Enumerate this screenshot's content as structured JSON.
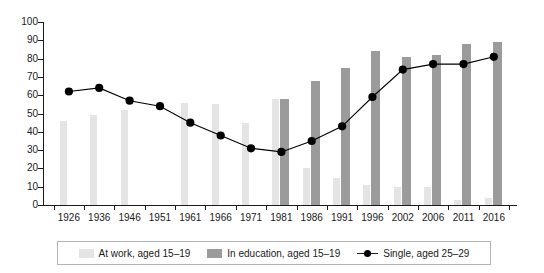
{
  "chart_data": {
    "type": "bar",
    "title": "",
    "subtitle": "",
    "xlabel": "",
    "ylabel": "",
    "ylim": [
      0,
      100
    ],
    "ytick_values": [
      0,
      10,
      20,
      30,
      40,
      50,
      60,
      70,
      80,
      90,
      100
    ],
    "ytick_labels": [
      "0",
      "10",
      "20",
      "30",
      "40",
      "50",
      "60",
      "70",
      "80",
      "90",
      "100"
    ],
    "grid": false,
    "legend_position": "bottom",
    "categories": [
      "1926",
      "1936",
      "1946",
      "1951",
      "1961",
      "1966",
      "1971",
      "1981",
      "1986",
      "1991",
      "1996",
      "2002",
      "2006",
      "2011",
      "2016"
    ],
    "series": [
      {
        "name": "At work, aged 15–19",
        "type": "bar",
        "color": "#e4e4e4",
        "values": [
          46,
          49,
          52,
          null,
          56,
          55,
          45,
          58,
          20,
          15,
          11,
          10,
          10,
          3,
          4
        ]
      },
      {
        "name": "In education, aged 15–19",
        "type": "bar",
        "color": "#9b9b9b",
        "values": [
          null,
          null,
          null,
          null,
          null,
          null,
          null,
          58,
          68,
          75,
          84,
          81,
          82,
          88,
          89
        ]
      },
      {
        "name": "Single, aged 25–29",
        "type": "line",
        "color": "#000000",
        "marker": "circle",
        "values": [
          62,
          64,
          57,
          54,
          45,
          38,
          31,
          29,
          35,
          43,
          59,
          74,
          77,
          77,
          81
        ]
      }
    ]
  },
  "legend": {
    "items": [
      {
        "label": "At work, aged 15–19",
        "swatch": "light-gray-square",
        "icon_name": "legend-swatch-at-work"
      },
      {
        "label": "In education, aged 15–19",
        "swatch": "medium-gray-square",
        "icon_name": "legend-swatch-in-education"
      },
      {
        "label": "Single, aged 25–29",
        "swatch": "black-line-marker",
        "icon_name": "legend-swatch-single"
      }
    ]
  },
  "colors": {
    "at_work": "#e4e4e4",
    "in_education": "#9b9b9b",
    "single_line": "#000000",
    "axis": "#1a1a1a",
    "legend_border": "#b4b4b4",
    "background": "#ffffff"
  }
}
